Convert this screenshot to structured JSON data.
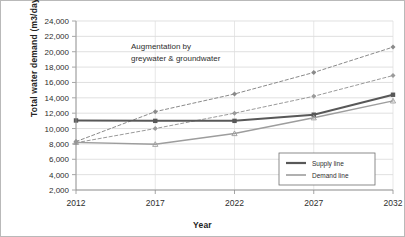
{
  "chart_data": {
    "type": "line",
    "title": "",
    "xlabel": "Year",
    "ylabel": "Total water demand (m3/day)",
    "x": [
      2012,
      2017,
      2022,
      2027,
      2032
    ],
    "xtick_labels": [
      "2012",
      "2017",
      "2022",
      "2027",
      "2032"
    ],
    "ytick_labels": [
      "24,000",
      "22,000",
      "20,000",
      "18,000",
      "16,000",
      "14,000",
      "12,000",
      "10,000",
      "8,000",
      "6,000",
      "4,000",
      "2,000"
    ],
    "ytick_values": [
      24000,
      22000,
      20000,
      18000,
      16000,
      14000,
      12000,
      10000,
      8000,
      6000,
      4000,
      2000
    ],
    "ylim": [
      2000,
      24000
    ],
    "xlim": [
      2012,
      2032
    ],
    "grid": true,
    "legend_position": "lower right",
    "series": [
      {
        "name": "Upper augmentation projection",
        "style": "dashed",
        "color": "#8a8a8a",
        "marker": "diamond",
        "values": [
          8300,
          12200,
          14500,
          17300,
          20600
        ]
      },
      {
        "name": "Lower augmentation projection",
        "style": "dashed",
        "color": "#9a9a9a",
        "marker": "diamond",
        "values": [
          8150,
          10000,
          12000,
          14200,
          16900
        ]
      },
      {
        "name": "Supply line",
        "style": "solid",
        "color": "#585858",
        "marker": "square",
        "values": [
          11050,
          11000,
          11000,
          11800,
          14400
        ]
      },
      {
        "name": "Demand line",
        "style": "solid",
        "color": "#9d9d9d",
        "marker": "triangle",
        "values": [
          8200,
          7950,
          9350,
          11400,
          13600
        ]
      }
    ],
    "annotations": [
      {
        "line1": "Augmentation by",
        "line2": "greywater & groundwater"
      }
    ],
    "legend_entries": [
      {
        "label": "Supply line",
        "color": "#585858",
        "width": 2.2
      },
      {
        "label": "Demand line",
        "color": "#9d9d9d",
        "width": 1.4
      }
    ]
  }
}
